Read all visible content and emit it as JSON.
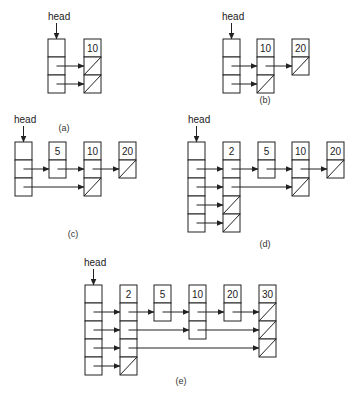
{
  "head_label": "head",
  "cell_size": 18,
  "colors": {
    "stroke": "#222222",
    "background": "#ffffff"
  },
  "panels": [
    {
      "id": "a",
      "caption": "(a)",
      "caption_pos": [
        64,
        131
      ],
      "head": {
        "x": 48,
        "y": 39,
        "levels": 2,
        "label_pos": [
          48,
          20
        ]
      },
      "nodes": [
        {
          "value": "10",
          "x": 84,
          "levels": 2
        }
      ],
      "links": [
        {
          "level": 1,
          "from": "head",
          "to": 0
        },
        {
          "level": 2,
          "from": "head",
          "to": 0
        }
      ]
    },
    {
      "id": "b",
      "caption": "(b)",
      "caption_pos": [
        265,
        103
      ],
      "head": {
        "x": 223,
        "y": 39,
        "levels": 2,
        "label_pos": [
          222,
          20
        ]
      },
      "nodes": [
        {
          "value": "10",
          "x": 257,
          "levels": 2
        },
        {
          "value": "20",
          "x": 292,
          "levels": 1
        }
      ],
      "links": [
        {
          "level": 1,
          "from": "head",
          "to": 0
        },
        {
          "level": 1,
          "from": 0,
          "to": 1
        },
        {
          "level": 2,
          "from": "head",
          "to": 0
        }
      ]
    },
    {
      "id": "c",
      "caption": "(c)",
      "caption_pos": [
        73,
        237
      ],
      "head": {
        "x": 15,
        "y": 142,
        "levels": 2,
        "label_pos": [
          14,
          123
        ]
      },
      "nodes": [
        {
          "value": "5",
          "x": 49,
          "levels": 1
        },
        {
          "value": "10",
          "x": 84,
          "levels": 2
        },
        {
          "value": "20",
          "x": 119,
          "levels": 1
        }
      ],
      "links": [
        {
          "level": 1,
          "from": "head",
          "to": 0
        },
        {
          "level": 1,
          "from": 0,
          "to": 1
        },
        {
          "level": 1,
          "from": 1,
          "to": 2
        },
        {
          "level": 2,
          "from": "head",
          "to": 1
        }
      ]
    },
    {
      "id": "d",
      "caption": "(d)",
      "caption_pos": [
        265,
        247
      ],
      "head": {
        "x": 188,
        "y": 142,
        "levels": 4,
        "label_pos": [
          188,
          123
        ]
      },
      "nodes": [
        {
          "value": "2",
          "x": 223,
          "levels": 4
        },
        {
          "value": "5",
          "x": 258,
          "levels": 1
        },
        {
          "value": "10",
          "x": 292,
          "levels": 2
        },
        {
          "value": "20",
          "x": 327,
          "levels": 1
        }
      ],
      "links": [
        {
          "level": 1,
          "from": "head",
          "to": 0
        },
        {
          "level": 1,
          "from": 0,
          "to": 1
        },
        {
          "level": 1,
          "from": 1,
          "to": 2
        },
        {
          "level": 1,
          "from": 2,
          "to": 3
        },
        {
          "level": 2,
          "from": "head",
          "to": 0
        },
        {
          "level": 2,
          "from": 0,
          "to": 2
        },
        {
          "level": 3,
          "from": "head",
          "to": 0
        },
        {
          "level": 4,
          "from": "head",
          "to": 0
        }
      ]
    },
    {
      "id": "e",
      "caption": "(e)",
      "caption_pos": [
        181,
        384
      ],
      "head": {
        "x": 85,
        "y": 285,
        "levels": 4,
        "label_pos": [
          84,
          266
        ]
      },
      "nodes": [
        {
          "value": "2",
          "x": 120,
          "levels": 4
        },
        {
          "value": "5",
          "x": 154,
          "levels": 1
        },
        {
          "value": "10",
          "x": 189,
          "levels": 2
        },
        {
          "value": "20",
          "x": 224,
          "levels": 1
        },
        {
          "value": "30",
          "x": 259,
          "levels": 3
        }
      ],
      "links": [
        {
          "level": 1,
          "from": "head",
          "to": 0
        },
        {
          "level": 1,
          "from": 0,
          "to": 1
        },
        {
          "level": 1,
          "from": 1,
          "to": 2
        },
        {
          "level": 1,
          "from": 2,
          "to": 3
        },
        {
          "level": 1,
          "from": 3,
          "to": 4
        },
        {
          "level": 2,
          "from": "head",
          "to": 0
        },
        {
          "level": 2,
          "from": 0,
          "to": 2
        },
        {
          "level": 2,
          "from": 2,
          "to": 4
        },
        {
          "level": 3,
          "from": "head",
          "to": 0
        },
        {
          "level": 3,
          "from": 0,
          "to": 4
        },
        {
          "level": 4,
          "from": "head",
          "to": 0
        }
      ]
    }
  ]
}
